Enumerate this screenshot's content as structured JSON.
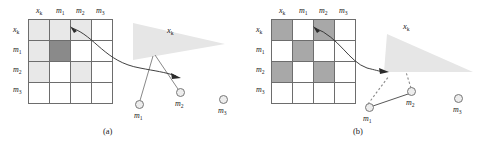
{
  "figure": {
    "colors": {
      "cell_white": "#ffffff",
      "cell_light": "#e8e8e8",
      "cell_dark": "#8a8a8a",
      "cell_mid": "#a8a8a8",
      "grid_line": "#6d6d6d",
      "cone_fill": "#e6e6e6",
      "node_fill": "#ededed",
      "node_stroke": "#777777",
      "arrow_stroke": "#333333",
      "text": "#1a1a1a"
    }
  },
  "panels": [
    {
      "id": "a",
      "caption": "(a)",
      "matrix": {
        "column_headers": [
          "x",
          "m",
          "m",
          "m"
        ],
        "column_header_subs": [
          "k",
          "1",
          "2",
          "3"
        ],
        "row_headers": [
          "x",
          "m",
          "m",
          "m"
        ],
        "row_header_subs": [
          "k",
          "1",
          "2",
          "3"
        ],
        "cells": [
          [
            "light",
            "light",
            "light",
            "white"
          ],
          [
            "light",
            "dark",
            "white",
            "white"
          ],
          [
            "light",
            "white",
            "light",
            "white"
          ],
          [
            "white",
            "white",
            "white",
            "white"
          ]
        ]
      },
      "scene": {
        "cone_label": "x",
        "cone_label_sub": "k",
        "nodes": [
          {
            "name": "m",
            "sub": "1",
            "label_pos": "below"
          },
          {
            "name": "m",
            "sub": "2",
            "label_pos": "below"
          },
          {
            "name": "m",
            "sub": "3",
            "label_pos": "below"
          }
        ],
        "edges": "solid-from-robot-to-m1-and-m2",
        "curved_arrow": "matrix-cell-to-scene"
      }
    },
    {
      "id": "b",
      "caption": "(b)",
      "matrix": {
        "column_headers": [
          "x",
          "m",
          "m",
          "m"
        ],
        "column_header_subs": [
          "k",
          "1",
          "2",
          "3"
        ],
        "row_headers": [
          "x",
          "m",
          "m",
          "m"
        ],
        "row_header_subs": [
          "k",
          "1",
          "2",
          "3"
        ],
        "cells": [
          [
            "mid",
            "white",
            "mid",
            "white"
          ],
          [
            "white",
            "mid",
            "white",
            "white"
          ],
          [
            "mid",
            "white",
            "mid",
            "white"
          ],
          [
            "white",
            "white",
            "white",
            "white"
          ]
        ]
      },
      "scene": {
        "cone_label": "x",
        "cone_label_sub": "k",
        "nodes": [
          {
            "name": "m",
            "sub": "1",
            "label_pos": "below"
          },
          {
            "name": "m",
            "sub": "2",
            "label_pos": "below"
          },
          {
            "name": "m",
            "sub": "3",
            "label_pos": "below"
          }
        ],
        "edges": "dashed-to-robot-solid-m1-m2",
        "curved_arrow": "matrix-cell-to-scene"
      }
    }
  ]
}
